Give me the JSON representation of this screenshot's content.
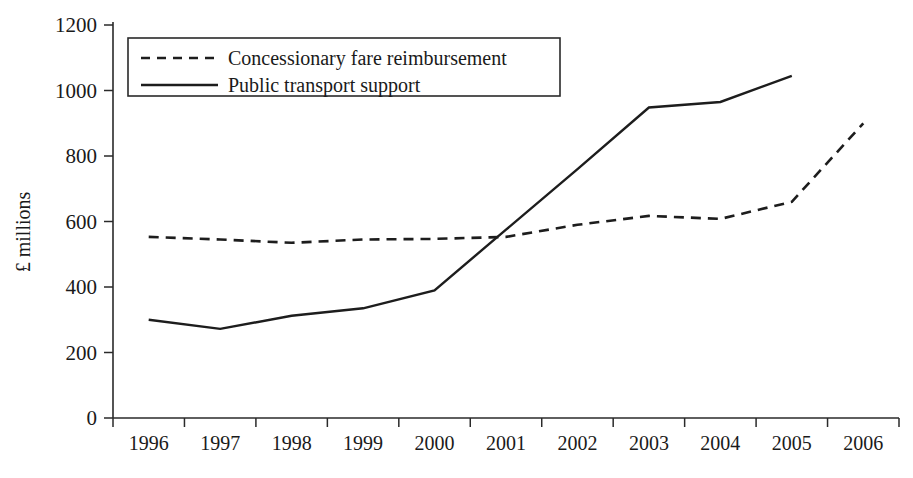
{
  "chart_data": {
    "type": "line",
    "title": "",
    "xlabel": "",
    "ylabel": "£ millions",
    "x": [
      1996,
      1997,
      1998,
      1999,
      2000,
      2001,
      2002,
      2003,
      2004,
      2005,
      2006
    ],
    "categories": [
      "1996",
      "1997",
      "1998",
      "1999",
      "2000",
      "2001",
      "2002",
      "2003",
      "2004",
      "2005",
      "2006"
    ],
    "ylim": [
      0,
      1200
    ],
    "yticks": [
      0,
      200,
      400,
      600,
      800,
      1000,
      1200
    ],
    "ytick_labels": [
      "0",
      "200",
      "400",
      "600",
      "800",
      "1000",
      "1200"
    ],
    "grid": false,
    "legend_position": "top-left",
    "series": [
      {
        "name": "Concessionary fare reimbursement",
        "style": "dashed",
        "color": "#1d1d1d",
        "x": [
          1996,
          1997,
          1998,
          1999,
          2000,
          2001,
          2002,
          2003,
          2004,
          2005,
          2006
        ],
        "values": [
          553,
          545,
          535,
          545,
          547,
          553,
          590,
          617,
          608,
          660,
          900
        ]
      },
      {
        "name": "Public transport support",
        "style": "solid",
        "color": "#1d1d1d",
        "x": [
          1996,
          1997,
          1998,
          1999,
          2000,
          2001,
          2002,
          2003,
          2004,
          2005
        ],
        "values": [
          300,
          272,
          312,
          335,
          390,
          575,
          760,
          948,
          965,
          1045
        ]
      }
    ]
  },
  "legend": {
    "items": [
      {
        "label": "Concessionary fare reimbursement",
        "style": "dashed"
      },
      {
        "label": "Public transport support",
        "style": "solid"
      }
    ]
  },
  "colors": {
    "series_ink": "#1d1d1d",
    "axis_ink": "#2a2a2a",
    "background": "#ffffff"
  }
}
